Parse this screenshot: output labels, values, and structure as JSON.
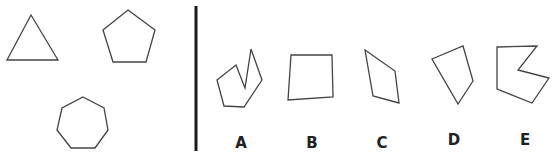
{
  "figure": {
    "width": 555,
    "height": 154,
    "stroke_color": "#444444",
    "divider_color": "#1a1a1a",
    "reference_shapes": [
      {
        "name": "triangle",
        "sides": 3,
        "points": "31,15 58,60 7,60"
      },
      {
        "name": "pentagon",
        "sides": 5,
        "points": "128,10 155,30 146,62 113,62 103,30"
      },
      {
        "name": "heptagon",
        "sides": 7,
        "points": "83,97 104,108 108,130 95,148 71,148 57,130 62,108"
      }
    ],
    "divider": {
      "x": 196,
      "y1": 6,
      "y2": 151
    },
    "options": [
      {
        "label": "A",
        "points": "217,80 236,65 245,88 251,49 262,80 244,107 224,106",
        "label_x": 229
      },
      {
        "label": "B",
        "points": "291,55 332,55 333,97 288,100",
        "label_x": 300
      },
      {
        "label": "C",
        "points": "365,50 395,71 399,103 373,96",
        "label_x": 370
      },
      {
        "label": "D",
        "points": "432,59 463,46 473,81 458,104",
        "label_x": 442
      },
      {
        "label": "E",
        "points": "497,47 537,46 518,70 549,78 532,103 497,89",
        "label_x": 513
      }
    ],
    "label_y": 134
  }
}
